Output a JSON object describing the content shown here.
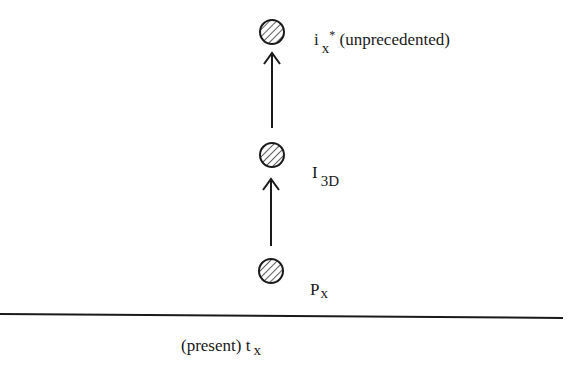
{
  "diagram": {
    "nodes": [
      {
        "id": "ix",
        "base": "i",
        "subscript": "x",
        "superscript": "*",
        "suffix": " (unprecedented)"
      },
      {
        "id": "I3D",
        "base": "I",
        "subscript": "3D"
      },
      {
        "id": "Px",
        "base": "P",
        "subscript": "x"
      }
    ],
    "edges": [
      {
        "from": "Px",
        "to": "I3D"
      },
      {
        "from": "I3D",
        "to": "ix"
      }
    ],
    "timeline": {
      "prefix": "(present) ",
      "base": "t",
      "subscript": "x"
    },
    "colors": {
      "stroke": "#1a1a1a",
      "background": "#ffffff"
    }
  }
}
